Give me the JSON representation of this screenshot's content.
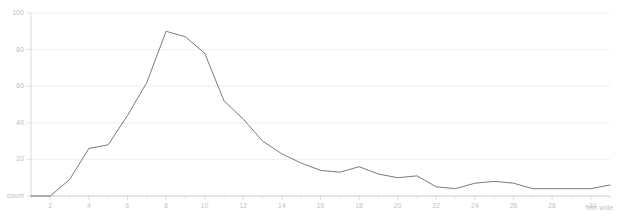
{
  "chart_data": {
    "type": "line",
    "title": "",
    "subtitle": "",
    "xlabel": "mm wide",
    "ylabel": "count",
    "grid": true,
    "legend": "none",
    "xlim": [
      1,
      31
    ],
    "ylim": [
      0,
      100
    ],
    "yticks": [
      0,
      20,
      40,
      60,
      80,
      100
    ],
    "ytick_labels": [
      "count",
      "20",
      "40",
      "60",
      "80",
      "100"
    ],
    "xticks": [
      2,
      4,
      6,
      8,
      10,
      12,
      14,
      16,
      18,
      20,
      22,
      24,
      26,
      28,
      30
    ],
    "xtick_labels": [
      "2",
      "4",
      "6",
      "8",
      "10",
      "12",
      "14",
      "16",
      "18",
      "20",
      "22",
      "24",
      "26",
      "28",
      ">30"
    ],
    "x": [
      1,
      2,
      3,
      4,
      5,
      6,
      7,
      8,
      9,
      10,
      11,
      12,
      13,
      14,
      15,
      16,
      17,
      18,
      19,
      20,
      21,
      22,
      23,
      24,
      25,
      26,
      27,
      28,
      29,
      30,
      31
    ],
    "values": [
      0,
      0,
      9,
      26,
      28,
      44,
      62,
      90,
      87,
      78,
      52,
      42,
      30,
      23,
      18,
      14,
      13,
      16,
      12,
      10,
      11,
      5,
      4,
      7,
      8,
      7,
      4,
      4,
      4,
      4,
      6
    ],
    "series": [
      {
        "name": "count",
        "color": "#6b6b6b",
        "values": [
          0,
          0,
          9,
          26,
          28,
          44,
          62,
          90,
          87,
          78,
          52,
          42,
          30,
          23,
          18,
          14,
          13,
          16,
          12,
          10,
          11,
          5,
          4,
          7,
          8,
          7,
          4,
          4,
          4,
          4,
          6
        ]
      }
    ],
    "peak": {
      "x": 8,
      "y": 90
    },
    "colors": {
      "line": "#6b6b6b",
      "grid": "#ececec",
      "axis": "#d8d8d8",
      "tick_text": "#c2c2c2",
      "background": "#ffffff"
    }
  }
}
